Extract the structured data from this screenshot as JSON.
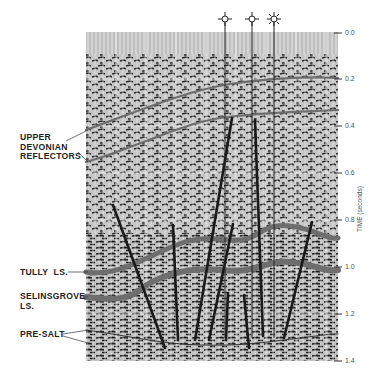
{
  "figure": {
    "type": "seismic-section",
    "axis": {
      "title": "TIME (seconds)",
      "ticks": [
        "0.0",
        "0.2",
        "0.4",
        "0.6",
        "0.8",
        "1.0",
        "1.2",
        "1.4"
      ]
    },
    "labels": {
      "upper_devonian": "UPPER\nDEVONIAN\nREFLECTORS",
      "tully": "TULLY  LS.",
      "selinsgrove": "SELINSGROVE\nLS.",
      "pre_salt": "PRE-SALT"
    },
    "wells": [
      {
        "symbol": "gas-well-icon",
        "x": 225
      },
      {
        "symbol": "gas-well-icon",
        "x": 252
      },
      {
        "symbol": "oil-gas-well-icon",
        "x": 274
      }
    ],
    "colors": {
      "background": "#ffffff",
      "section_gray": "#b8b8b8",
      "horizon": "#6e6e6e",
      "fault": "#1a1a1a",
      "text": "#222222"
    }
  }
}
